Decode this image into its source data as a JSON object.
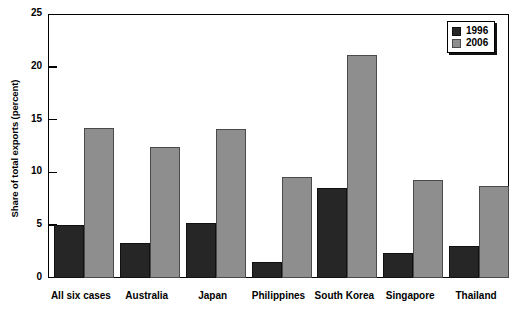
{
  "chart_data": {
    "type": "bar",
    "title": "",
    "xlabel": "",
    "ylabel": "Share of total exports (percent)",
    "ylim": [
      0,
      25
    ],
    "yticks": [
      0,
      5,
      10,
      15,
      20,
      25
    ],
    "grid": false,
    "legend_position": "top-right",
    "categories": [
      "All six cases",
      "Australia",
      "Japan",
      "Philippines",
      "South Korea",
      "Singapore",
      "Thailand"
    ],
    "series": [
      {
        "name": "1996",
        "color": "#262626",
        "values": [
          5.0,
          3.3,
          5.2,
          1.5,
          8.5,
          2.4,
          3.0
        ]
      },
      {
        "name": "2006",
        "color": "#8e8e8e",
        "values": [
          14.2,
          12.4,
          14.1,
          9.6,
          21.1,
          9.3,
          8.7
        ]
      }
    ]
  }
}
